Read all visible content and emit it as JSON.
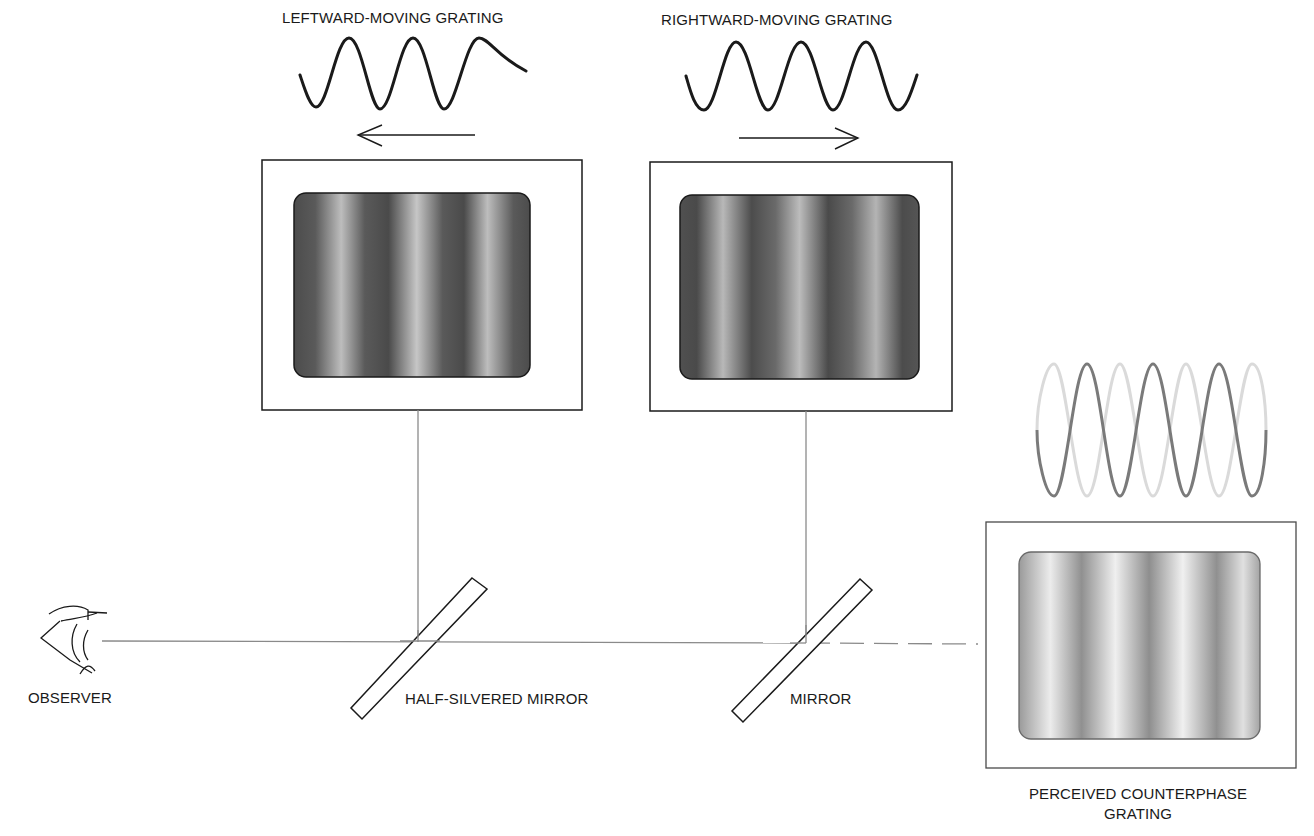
{
  "figure": {
    "type": "optical-setup-diagram",
    "background": "#ffffff",
    "line_color": "#1a1a1a",
    "beam_color": "#808080"
  },
  "labels": {
    "left_grating": "LEFTWARD-MOVING GRATING",
    "right_grating": "RIGHTWARD-MOVING GRATING",
    "observer": "OBSERVER",
    "half_silvered_mirror": "HALF-SILVERED MIRROR",
    "mirror": "MIRROR",
    "perceived_line1": "PERCEIVED COUNTERPHASE",
    "perceived_line2": "GRATING"
  },
  "components": {
    "left_display": {
      "waveform": "sine",
      "cycles": 3.5,
      "direction": "left",
      "screen_gradient": "dark-grating",
      "stripe_period_px": 78
    },
    "right_display": {
      "waveform": "sine",
      "cycles": 3.5,
      "direction": "right",
      "screen_gradient": "dark-grating",
      "stripe_period_px": 78
    },
    "perceived_display": {
      "waveforms": [
        "sine-dark",
        "sine-light-counterphase"
      ],
      "screen_gradient": "light-grating",
      "stripe_period_px": 78
    },
    "observer_icon": "eye-icon",
    "beam": {
      "solid_from": "observer",
      "solid_to": "mirror",
      "dashed_to": "perceived-display"
    }
  },
  "colors": {
    "dark_wave": "#1a1a1a",
    "counterphase_dark": "#7a7a7a",
    "counterphase_light": "#d8d8d8",
    "grating_dark": "#4a4a4a",
    "grating_light": "#c4c4c4",
    "perceived_dark": "#8c8c8c",
    "perceived_light": "#efefef"
  }
}
